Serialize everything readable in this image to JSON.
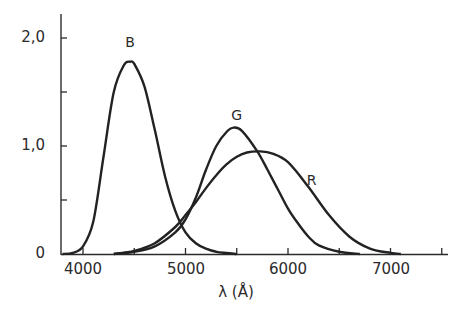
{
  "chart_data": {
    "type": "line",
    "title": "",
    "xlabel": "λ (Å)",
    "ylabel": "",
    "xlim": [
      3800,
      7550
    ],
    "ylim": [
      0,
      2.2
    ],
    "grid": false,
    "x_ticks": [
      4000,
      4500,
      5000,
      5500,
      6000,
      6500,
      7000,
      7500
    ],
    "x_tick_labels": [
      "4000",
      "5000",
      "6000",
      "7000"
    ],
    "y_ticks": [
      0,
      0.5,
      1.0,
      1.5,
      2.0
    ],
    "y_tick_labels": [
      "0",
      "1,0",
      "2,0"
    ],
    "series": [
      {
        "name": "B",
        "x": [
          3800,
          3900,
          4000,
          4100,
          4200,
          4300,
          4400,
          4460,
          4500,
          4600,
          4700,
          4800,
          4900,
          5000,
          5100,
          5200,
          5300,
          5400,
          5500
        ],
        "values": [
          0.0,
          0.01,
          0.07,
          0.3,
          0.9,
          1.5,
          1.75,
          1.78,
          1.76,
          1.55,
          1.15,
          0.72,
          0.4,
          0.2,
          0.1,
          0.05,
          0.02,
          0.01,
          0.0
        ]
      },
      {
        "name": "G",
        "x": [
          4300,
          4500,
          4700,
          4900,
          5000,
          5100,
          5200,
          5300,
          5400,
          5470,
          5550,
          5700,
          5800,
          5900,
          6000,
          6100,
          6200,
          6300,
          6500,
          6700
        ],
        "values": [
          0.0,
          0.02,
          0.07,
          0.2,
          0.32,
          0.52,
          0.78,
          1.0,
          1.13,
          1.17,
          1.14,
          0.95,
          0.78,
          0.6,
          0.42,
          0.28,
          0.16,
          0.08,
          0.02,
          0.0
        ]
      },
      {
        "name": "R",
        "x": [
          4300,
          4500,
          4700,
          4900,
          5000,
          5100,
          5200,
          5300,
          5400,
          5500,
          5600,
          5730,
          5850,
          6000,
          6200,
          6400,
          6600,
          6800,
          7000,
          7100
        ],
        "values": [
          0.0,
          0.03,
          0.1,
          0.25,
          0.36,
          0.48,
          0.61,
          0.73,
          0.83,
          0.9,
          0.94,
          0.95,
          0.93,
          0.85,
          0.62,
          0.36,
          0.16,
          0.05,
          0.01,
          0.0
        ]
      }
    ],
    "annotations": [
      {
        "text": "B",
        "x": 4460,
        "y": 1.95
      },
      {
        "text": "G",
        "x": 5500,
        "y": 1.28
      },
      {
        "text": "R",
        "x": 6230,
        "y": 0.68
      }
    ],
    "line_color": "#222222"
  }
}
